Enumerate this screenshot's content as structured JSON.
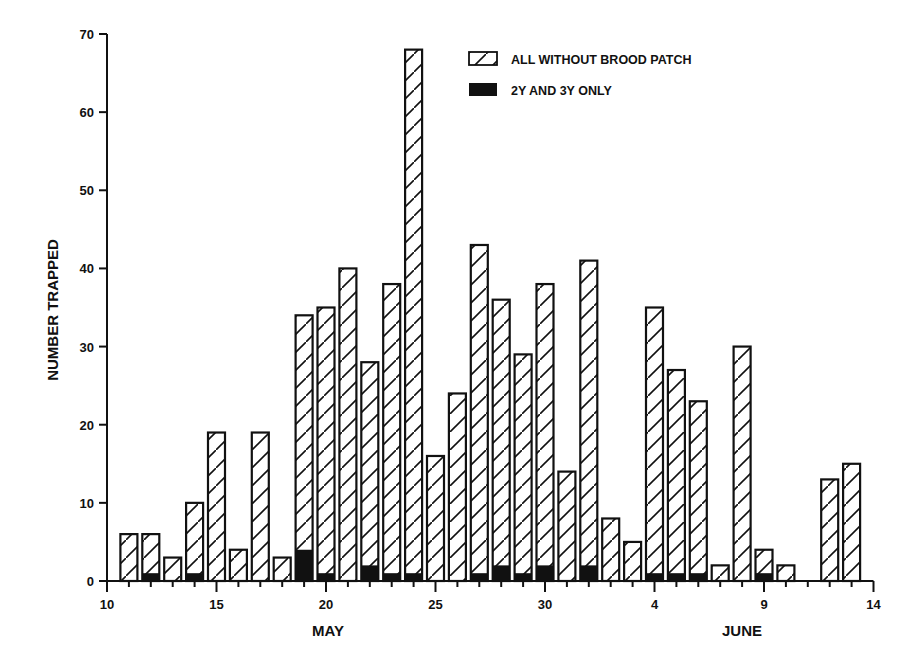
{
  "chart_data": {
    "type": "bar",
    "stacked_overlay": true,
    "title": "",
    "xlabel_groups": [
      {
        "label": "MAY",
        "center_tick": 20
      },
      {
        "label": "JUNE",
        "center_tick": 39
      }
    ],
    "ylabel": "NUMBER TRAPPED",
    "ylim": [
      0,
      70
    ],
    "yticks": [
      0,
      10,
      20,
      30,
      40,
      50,
      60,
      70
    ],
    "x_axis": {
      "tick_start": 10,
      "tick_end": 45,
      "labels": [
        {
          "pos": 10,
          "text": "10"
        },
        {
          "pos": 15,
          "text": "15"
        },
        {
          "pos": 20,
          "text": "20"
        },
        {
          "pos": 25,
          "text": "25"
        },
        {
          "pos": 30,
          "text": "30"
        },
        {
          "pos": 35,
          "text": "4"
        },
        {
          "pos": 40,
          "text": "9"
        },
        {
          "pos": 45,
          "text": "14"
        }
      ]
    },
    "grid": false,
    "legend_position": "top-right",
    "categories": [
      "May 11",
      "May 12",
      "May 13",
      "May 14",
      "May 15",
      "May 16",
      "May 17",
      "May 18",
      "May 19",
      "May 20",
      "May 21",
      "May 22",
      "May 23",
      "May 24",
      "May 25",
      "May 26",
      "May 27",
      "May 28",
      "May 29",
      "May 30",
      "May 31",
      "Jun 1",
      "Jun 2",
      "Jun 3",
      "Jun 4",
      "Jun 5",
      "Jun 6",
      "Jun 7",
      "Jun 8",
      "Jun 9",
      "Jun 10",
      "Jun 11",
      "Jun 12",
      "Jun 13"
    ],
    "positions": [
      11,
      12,
      13,
      14,
      15,
      16,
      17,
      18,
      19,
      20,
      21,
      22,
      23,
      24,
      25,
      26,
      27,
      28,
      29,
      30,
      31,
      32,
      33,
      34,
      35,
      36,
      37,
      38,
      39,
      40,
      41,
      42,
      43,
      44
    ],
    "series": [
      {
        "name": "ALL WITHOUT BROOD PATCH",
        "pattern": "hatched",
        "values": [
          6,
          6,
          3,
          10,
          19,
          4,
          19,
          3,
          34,
          35,
          40,
          28,
          38,
          68,
          16,
          24,
          43,
          36,
          29,
          38,
          14,
          41,
          8,
          5,
          35,
          27,
          23,
          2,
          30,
          4,
          2,
          0,
          13,
          15
        ]
      },
      {
        "name": "2Y AND 3Y ONLY",
        "pattern": "solid-black",
        "values": [
          0,
          1,
          0,
          1,
          0,
          0,
          0,
          0,
          4,
          1,
          0,
          2,
          1,
          1,
          0,
          0,
          1,
          2,
          1,
          2,
          0,
          2,
          0,
          0,
          1,
          1,
          1,
          0,
          0,
          1,
          0,
          0,
          0,
          0
        ]
      }
    ]
  },
  "legend": {
    "items": [
      {
        "label": "ALL WITHOUT BROOD PATCH",
        "icon": "hatched-box-icon"
      },
      {
        "label": "2Y AND 3Y ONLY",
        "icon": "solid-black-box-icon"
      }
    ]
  },
  "axes": {
    "y_title": "NUMBER TRAPPED",
    "x_group_may": "MAY",
    "x_group_june": "JUNE"
  },
  "colors": {
    "ink": "#111111",
    "background": "#ffffff"
  }
}
